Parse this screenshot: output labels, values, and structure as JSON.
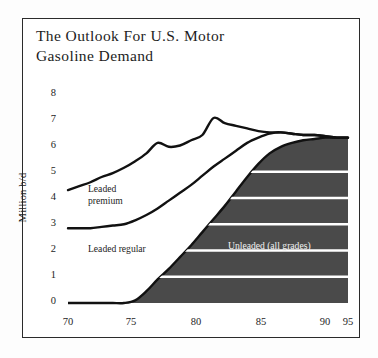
{
  "title": "The Outlook For U.S. Motor Gasoline Demand",
  "title_line1": "The Outlook For U.S. Motor",
  "title_line2": "Gasoline Demand",
  "colors": {
    "unleaded_fill": "#4a4a4a",
    "line": "#111111",
    "gridline": "#ffffff",
    "frame": "#2b2b2b",
    "background": "#ffffff",
    "unleaded_label_text": "#f2f2f2"
  },
  "series_labels": {
    "premium_line1": "Leaded",
    "premium_line2": "premium",
    "regular": "Leaded  regular",
    "unleaded": "Unleaded (all grades)"
  },
  "chart_data": {
    "type": "area",
    "title": "The Outlook For U.S. Motor Gasoline Demand",
    "xlabel": "",
    "ylabel": "Million b/d",
    "xlim": [
      70,
      95
    ],
    "ylim": [
      0,
      8
    ],
    "xtick_labels": [
      "70",
      "75",
      "80",
      "85",
      "90",
      "95"
    ],
    "xticks": [
      70,
      75,
      80,
      85,
      90,
      95
    ],
    "ytick_labels": [
      "0",
      "1",
      "2",
      "3",
      "4",
      "5",
      "6",
      "7",
      "8"
    ],
    "yticks": [
      0,
      1,
      2,
      3,
      4,
      5,
      6,
      7,
      8
    ],
    "grid": "horizontal white gridlines drawn only inside shaded unleaded area at y = 1,2,3,4,5",
    "legend": "inline labels placed on the bands",
    "stacked": true,
    "x": [
      70,
      71,
      72,
      73,
      74,
      75,
      76,
      77,
      78,
      79,
      80,
      81,
      82,
      83,
      84,
      85,
      86,
      87,
      88,
      89,
      90,
      91,
      92,
      93,
      94,
      95
    ],
    "series": [
      {
        "name": "Unleaded (all grades)",
        "note": "bottom dark shaded band, cumulative value = band top",
        "values": [
          0,
          0,
          0,
          0,
          0,
          0,
          0.1,
          0.45,
          0.9,
          1.3,
          1.75,
          2.2,
          2.7,
          3.2,
          3.7,
          4.25,
          4.8,
          5.3,
          5.7,
          5.95,
          6.1,
          6.2,
          6.25,
          6.3,
          6.3,
          6.3
        ]
      },
      {
        "name": "Leaded regular",
        "note": "middle white band, cumulative top of regular + unleaded",
        "values": [
          2.85,
          2.85,
          2.85,
          2.9,
          2.95,
          3.0,
          3.15,
          3.35,
          3.6,
          3.9,
          4.2,
          4.5,
          4.85,
          5.2,
          5.5,
          5.8,
          6.1,
          6.3,
          6.45,
          6.5,
          6.45,
          6.4,
          6.4,
          6.35,
          6.3,
          6.3
        ]
      },
      {
        "name": "Leaded premium",
        "note": "top white band, cumulative top = total demand curve",
        "values": [
          4.3,
          4.45,
          4.6,
          4.8,
          4.95,
          5.15,
          5.4,
          5.7,
          6.1,
          5.95,
          6.0,
          6.2,
          6.4,
          7.05,
          6.85,
          6.75,
          6.65,
          6.55,
          6.5,
          6.5,
          6.45,
          6.4,
          6.4,
          6.35,
          6.3,
          6.3
        ]
      }
    ],
    "annotations": [
      {
        "text": "Leaded premium",
        "x": 74,
        "y": 4.3
      },
      {
        "text": "Leaded  regular",
        "x": 74,
        "y": 2.1
      },
      {
        "text": "Unleaded (all grades)",
        "x": 86,
        "y": 2.3
      }
    ]
  }
}
